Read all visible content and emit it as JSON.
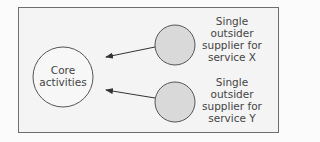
{
  "diagram": {
    "core": {
      "label": "Core\nactivities"
    },
    "suppliers": [
      {
        "id": "x",
        "label": "Single\noutsider\nsupplier for\nservice X"
      },
      {
        "id": "y",
        "label": "Single\noutsider\nsupplier for\nservice Y"
      }
    ],
    "colors": {
      "frame_border": "#6e6e6e",
      "frame_fill": "#f4f4f4",
      "core_fill": "#f7f7f7",
      "supplier_fill": "#d9d9d9",
      "stroke": "#555555",
      "text": "#444444"
    }
  }
}
